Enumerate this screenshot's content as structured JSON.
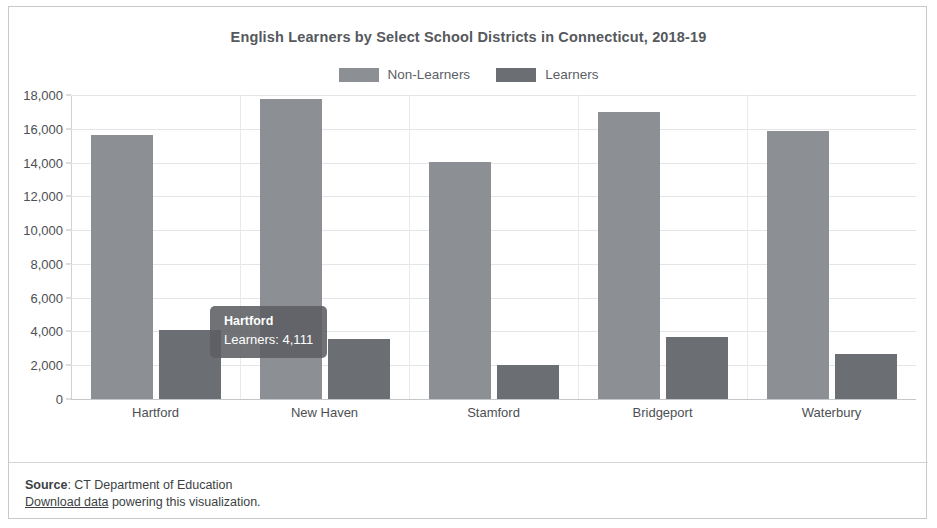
{
  "chart_data": {
    "type": "bar",
    "title": "English Learners by Select School Districts in Connecticut, 2018-19",
    "xlabel": "",
    "ylabel": "",
    "categories": [
      "Hartford",
      "New Haven",
      "Stamford",
      "Bridgeport",
      "Waterbury"
    ],
    "series": [
      {
        "name": "Non-Learners",
        "color": "#8c8f93",
        "values": [
          15630,
          17760,
          14030,
          16990,
          15870
        ]
      },
      {
        "name": "Learners",
        "color": "#6b6e72",
        "values": [
          4111,
          3550,
          2010,
          3670,
          2660
        ]
      }
    ],
    "ylim": [
      0,
      18000
    ],
    "yticks": [
      0,
      2000,
      4000,
      6000,
      8000,
      10000,
      12000,
      14000,
      16000,
      18000
    ],
    "ytick_labels": [
      "0",
      "2,000",
      "4,000",
      "6,000",
      "8,000",
      "10,000",
      "12,000",
      "14,000",
      "16,000",
      "18,000"
    ],
    "grid": true,
    "legend_position": "top-center"
  },
  "legend": {
    "entries": [
      {
        "label": "Non-Learners",
        "color": "#8c8f93"
      },
      {
        "label": "Learners",
        "color": "#6b6e72"
      }
    ]
  },
  "tooltip": {
    "title": "Hartford",
    "value": "Learners: 4,111"
  },
  "footer": {
    "source_label": "Source",
    "source_separator": ": ",
    "source_value": "CT Department of Education",
    "download_link": "Download data",
    "download_rest": " powering this visualization."
  }
}
